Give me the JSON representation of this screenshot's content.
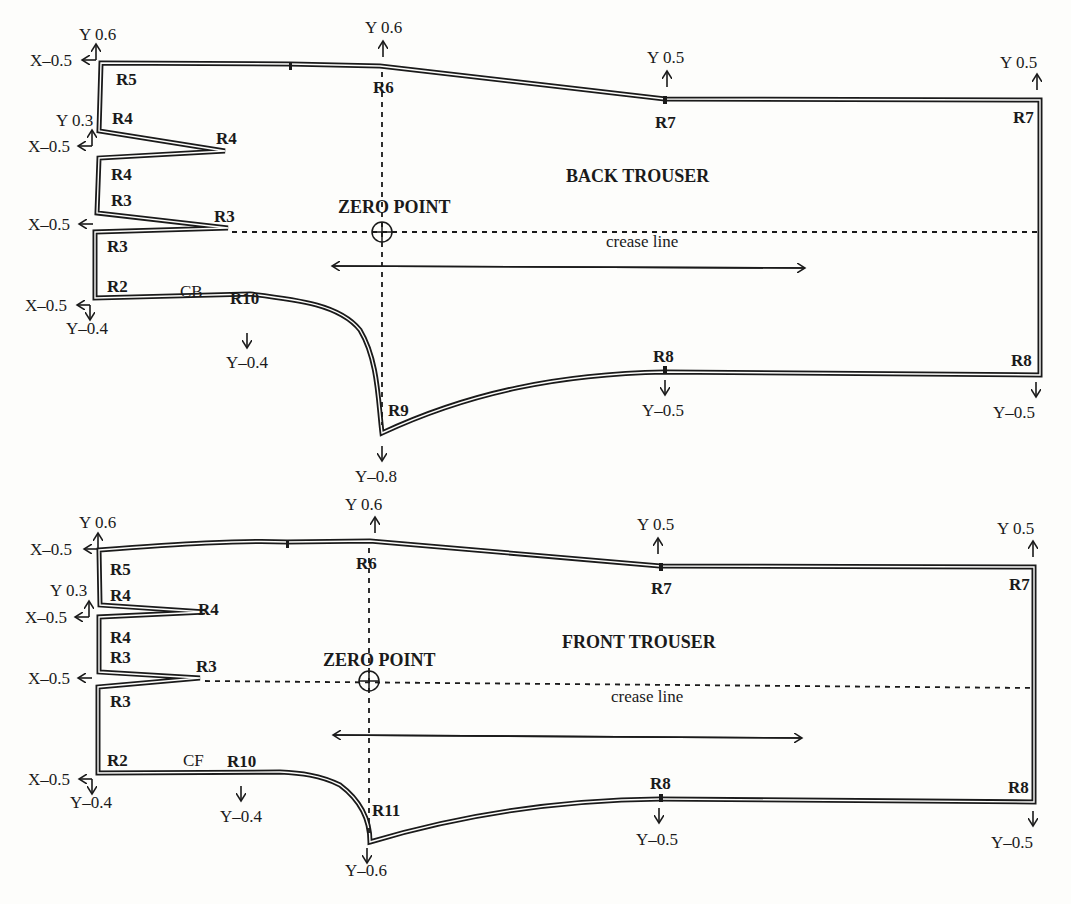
{
  "back": {
    "title": "BACK TROUSER",
    "zero_point": "ZERO POINT",
    "crease": "crease line",
    "seam": "CB",
    "points": {
      "R5": "R5",
      "R4a": "R4",
      "R4tip": "R4",
      "R4b": "R4",
      "R3a": "R3",
      "R3tip": "R3",
      "R3b": "R3",
      "R2": "R2",
      "R10": "R10",
      "R6": "R6",
      "R7top": "R7",
      "R7corner": "R7",
      "R9": "R9",
      "R8mid": "R8",
      "R8corner": "R8"
    },
    "grades": {
      "r5_y": "Y 0.6",
      "r5_x": "X–0.5",
      "r4_y": "Y 0.3",
      "r4_x": "X–0.5",
      "r3_x": "X–0.5",
      "r2_x": "X–0.5",
      "r2_y": "Y–0.4",
      "r10_y": "Y–0.4",
      "r6_y": "Y 0.6",
      "r7_y": "Y 0.5",
      "r7c_y": "Y 0.5",
      "r9_y": "Y–0.8",
      "r8_y": "Y–0.5",
      "r8c_y": "Y–0.5"
    }
  },
  "front": {
    "title": "FRONT TROUSER",
    "zero_point": "ZERO POINT",
    "crease": "crease line",
    "seam": "CF",
    "points": {
      "R5": "R5",
      "R4a": "R4",
      "R4tip": "R4",
      "R4b": "R4",
      "R3a": "R3",
      "R3tip": "R3",
      "R3b": "R3",
      "R2": "R2",
      "R10": "R10",
      "R6": "R6",
      "R7top": "R7",
      "R7corner": "R7",
      "R11": "R11",
      "R8mid": "R8",
      "R8corner": "R8"
    },
    "grades": {
      "r5_y": "Y 0.6",
      "r5_x": "X–0.5",
      "r4_y": "Y 0.3",
      "r4_x": "X–0.5",
      "r3_x": "X–0.5",
      "r2_x": "X–0.5",
      "r2_y": "Y–0.4",
      "r10_y": "Y–0.4",
      "r6_y": "Y 0.6",
      "r7_y": "Y 0.5",
      "r7c_y": "Y 0.5",
      "r11_y": "Y–0.6",
      "r8_y": "Y–0.5",
      "r8c_y": "Y–0.5"
    }
  }
}
